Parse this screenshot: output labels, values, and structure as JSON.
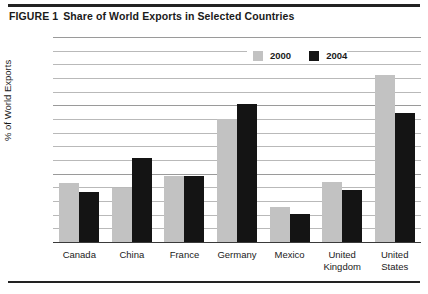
{
  "figure": {
    "number_label": "FIGURE 1",
    "title": "Share of World Exports in Selected Countries"
  },
  "legend": {
    "position": "top-right",
    "entries": [
      {
        "label": "2000",
        "color": "#c2c2c2",
        "swatch_name": "legend-swatch-2000"
      },
      {
        "label": "2004",
        "color": "#141414",
        "swatch_name": "legend-swatch-2004"
      }
    ]
  },
  "axes": {
    "ylabel": "% of World Exports",
    "ytick_labels": [
      "0",
      "5",
      "10",
      "15"
    ],
    "ytick_values": [
      0,
      5,
      10,
      15
    ],
    "ylim": [
      0,
      15
    ],
    "minor_gridline_step": 1,
    "grid": true,
    "xlabel": ""
  },
  "chart_data": {
    "type": "bar",
    "title": "Share of World Exports in Selected Countries",
    "xlabel": "",
    "ylabel": "% of World Exports",
    "ylim": [
      0,
      15
    ],
    "grid": true,
    "legend_position": "top-right",
    "categories": [
      "Canada",
      "China",
      "France",
      "Germany",
      "Mexico",
      "United Kingdom",
      "United States"
    ],
    "series": [
      {
        "name": "2000",
        "color": "#c2c2c2",
        "values": [
          4.4,
          4.0,
          4.9,
          9.1,
          2.6,
          4.5,
          12.3
        ]
      },
      {
        "name": "2004",
        "color": "#141414",
        "values": [
          3.7,
          6.2,
          4.9,
          10.2,
          2.1,
          3.9,
          9.5
        ]
      }
    ]
  }
}
